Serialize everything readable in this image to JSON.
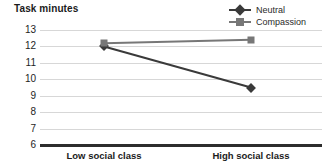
{
  "chart_data": {
    "type": "line",
    "title": "Task minutes",
    "xlabel": "",
    "ylabel": "Task minutes",
    "categories": [
      "Low social class",
      "High social class"
    ],
    "ylim": [
      6,
      13
    ],
    "yticks": [
      13,
      12,
      11,
      10,
      9,
      8,
      7,
      6
    ],
    "grid": true,
    "legend_position": "top-right",
    "series": [
      {
        "name": "Neutral",
        "values": [
          12.0,
          9.5
        ],
        "color": "#3a3a3a",
        "marker": "diamond"
      },
      {
        "name": "Compassion",
        "values": [
          12.2,
          12.4
        ],
        "color": "#777777",
        "marker": "square"
      }
    ]
  },
  "axis": {
    "baseline_color": "#2d2d2d",
    "gridline_color": "#d7d7d7"
  }
}
